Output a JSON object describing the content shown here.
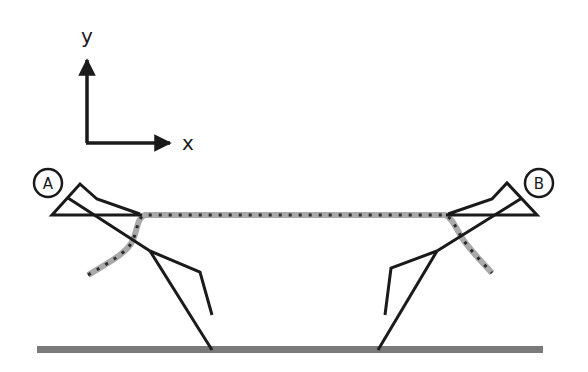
{
  "diagram": {
    "axes": {
      "x_label": "x",
      "y_label": "y"
    },
    "figures": [
      {
        "id": "A",
        "label": "A"
      },
      {
        "id": "B",
        "label": "B"
      }
    ],
    "colors": {
      "line": "#1a1a1a",
      "rope": "#a9a9a9",
      "rope_stripe": "#2b2b2b",
      "ground": "#7a7a7a"
    }
  }
}
